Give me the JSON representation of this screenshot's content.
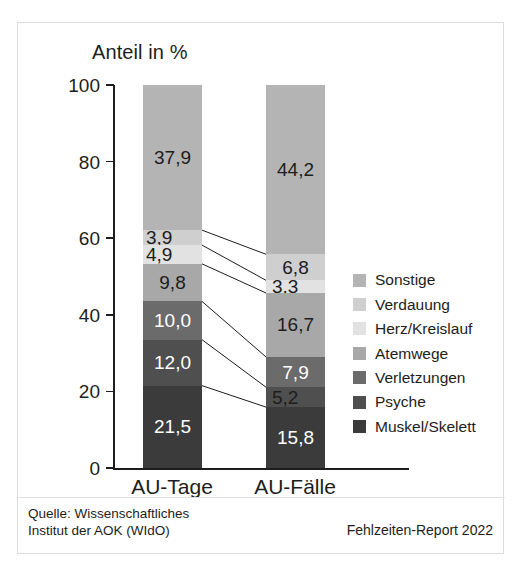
{
  "figure": {
    "axis_title": "Anteil in %",
    "source": "Quelle: Wissenschaftliches\nInstitut der AOK (WIdO)",
    "report": "Fehlzeiten-Report 2022"
  },
  "chart_data": {
    "type": "bar",
    "subtype": "stacked-100-percent",
    "title": "Anteil in %",
    "xlabel": "",
    "ylabel": "Anteil in %",
    "ylim": [
      0,
      100
    ],
    "yticks": [
      0,
      20,
      40,
      60,
      80,
      100
    ],
    "ytick_labels": [
      "0",
      "20",
      "40",
      "60",
      "80",
      "100"
    ],
    "grid": false,
    "legend_position": "right",
    "categories": [
      "AU-Tage",
      "AU-Fälle"
    ],
    "series": [
      {
        "name": "Muskel/Skelett",
        "color": "#3b3b3b",
        "values": [
          21.5,
          15.8
        ],
        "labels": [
          "21,5",
          "15,8"
        ]
      },
      {
        "name": "Psyche",
        "color": "#4f4f4f",
        "values": [
          12.0,
          5.2
        ],
        "labels": [
          "12,0",
          "5,2"
        ]
      },
      {
        "name": "Verletzungen",
        "color": "#6b6b6b",
        "values": [
          10.0,
          7.9
        ],
        "labels": [
          "10,0",
          "7,9"
        ]
      },
      {
        "name": "Atemwege",
        "color": "#a8a8a8",
        "values": [
          9.8,
          16.7
        ],
        "labels": [
          "9,8",
          "16,7"
        ]
      },
      {
        "name": "Herz/Kreislauf",
        "color": "#e2e2e2",
        "values": [
          4.9,
          3.3
        ],
        "labels": [
          "4,9",
          "3,3"
        ]
      },
      {
        "name": "Verdauung",
        "color": "#cfcfcf",
        "values": [
          3.9,
          6.8
        ],
        "labels": [
          "3,9",
          "6,8"
        ]
      },
      {
        "name": "Sonstige",
        "color": "#b4b4b4",
        "values": [
          37.9,
          44.2
        ],
        "labels": [
          "37,9",
          "44,2"
        ]
      }
    ],
    "legend_entries": [
      "Sonstige",
      "Verdauung",
      "Herz/Kreislauf",
      "Atemwege",
      "Verletzungen",
      "Psyche",
      "Muskel/Skelett"
    ],
    "annotations": [
      "Quelle: Wissenschaftliches Institut der AOK (WIdO)",
      "Fehlzeiten-Report 2022"
    ]
  }
}
